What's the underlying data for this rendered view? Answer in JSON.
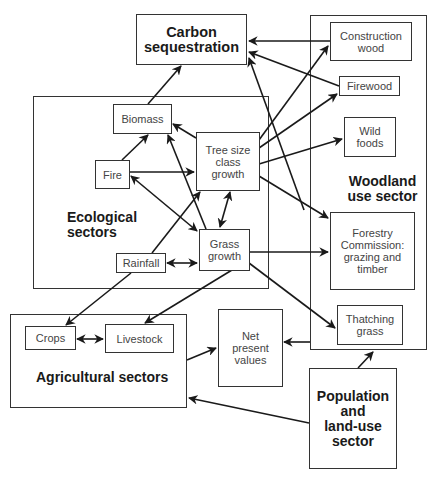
{
  "diagram": {
    "type": "flow-diagram",
    "nodes": {
      "carbon_sequestration": "Carbon\nsequestration",
      "woodland_use_sector": "Woodland\nuse sector",
      "construction_wood": "Construction\nwood",
      "firewood": "Firewood",
      "wild_foods": "Wild\nfoods",
      "forestry_commission": "Forestry\nCommission:\ngrazing and\ntimber",
      "thatching_grass": "Thatching\ngrass",
      "ecological_sectors": "Ecological\nsectors",
      "biomass": "Biomass",
      "tree_size_class_growth": "Tree size\nclass\ngrowth",
      "fire": "Fire",
      "grass_growth": "Grass\ngrowth",
      "rainfall": "Rainfall",
      "agricultural_sectors": "Agricultural sectors",
      "crops": "Crops",
      "livestock": "Livestock",
      "net_present_values": "Net\npresent\nvalues",
      "population_land_use_sector": "Population\nand\nland-use\nsector"
    },
    "edges": [
      {
        "from": "Construction wood",
        "to": "Carbon sequestration"
      },
      {
        "from": "Firewood",
        "to": "Carbon sequestration"
      },
      {
        "from": "Forestry Commission: grazing and timber",
        "to": "Carbon sequestration"
      },
      {
        "from": "Biomass",
        "to": "Carbon sequestration"
      },
      {
        "from": "Tree size class growth",
        "to": "Biomass"
      },
      {
        "from": "Grass growth",
        "to": "Biomass"
      },
      {
        "from": "Fire",
        "to": "Biomass"
      },
      {
        "from": "Fire",
        "to": "Tree size class growth"
      },
      {
        "from": "Fire",
        "to": "Grass growth",
        "bidirectional": true
      },
      {
        "from": "Rainfall",
        "to": "Tree size class growth"
      },
      {
        "from": "Rainfall",
        "to": "Grass growth",
        "bidirectional": true
      },
      {
        "from": "Tree size class growth",
        "to": "Grass growth",
        "bidirectional": true
      },
      {
        "from": "Tree size class growth",
        "to": "Construction wood"
      },
      {
        "from": "Tree size class growth",
        "to": "Firewood"
      },
      {
        "from": "Tree size class growth",
        "to": "Wild foods"
      },
      {
        "from": "Tree size class growth",
        "to": "Forestry Commission: grazing and timber"
      },
      {
        "from": "Grass growth",
        "to": "Forestry Commission: grazing and timber"
      },
      {
        "from": "Grass growth",
        "to": "Thatching grass"
      },
      {
        "from": "Grass growth",
        "to": "Livestock"
      },
      {
        "from": "Rainfall",
        "to": "Crops"
      },
      {
        "from": "Crops",
        "to": "Livestock",
        "bidirectional": true
      },
      {
        "from": "Agricultural sectors",
        "to": "Net present values"
      },
      {
        "from": "Woodland use sector",
        "to": "Net present values"
      },
      {
        "from": "Population and land-use sector",
        "to": "Woodland use sector"
      },
      {
        "from": "Population and land-use sector",
        "to": "Agricultural sectors"
      }
    ],
    "colors": {
      "stroke": "#1a1a1a",
      "box_border": "#333333",
      "background": "#ffffff"
    }
  }
}
